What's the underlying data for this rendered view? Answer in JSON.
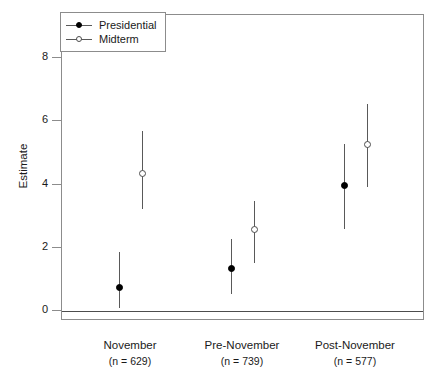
{
  "chart_data": {
    "type": "scatter",
    "title": "",
    "xlabel": "",
    "ylabel": "Estimate",
    "ylim": [
      -0.55,
      9.2
    ],
    "yticks": [
      0,
      2,
      4,
      6,
      8
    ],
    "ytick_labels": [
      "0",
      "2",
      "4",
      "6",
      "8"
    ],
    "grid": false,
    "zero_line": 0,
    "legend_position": "top-left",
    "categories": [
      "November",
      "Pre-November",
      "Post-November"
    ],
    "category_n": [
      "(n = 629)",
      "(n = 739)",
      "(n = 577)"
    ],
    "series": [
      {
        "name": "Presidential",
        "marker": "filled-circle",
        "color": "#000000",
        "values": [
          0.73,
          1.36,
          3.96
        ],
        "ci_low": [
          0.09,
          0.55,
          2.6
        ],
        "ci_high": [
          1.86,
          2.28,
          5.29
        ]
      },
      {
        "name": "Midterm",
        "marker": "open-circle",
        "color": "#4d4d4d",
        "values": [
          4.34,
          2.59,
          5.28
        ],
        "ci_low": [
          3.23,
          1.52,
          3.92
        ],
        "ci_high": [
          5.7,
          3.49,
          6.55
        ]
      }
    ]
  },
  "legend": {
    "items": [
      {
        "label": "Presidential",
        "marker": "filled-circle"
      },
      {
        "label": "Midterm",
        "marker": "open-circle"
      }
    ]
  },
  "axes": {
    "y_title": "Estimate",
    "y_tick_labels": [
      "0",
      "2",
      "4",
      "6",
      "8"
    ]
  },
  "x_groups": [
    {
      "label": "November",
      "n": "(n = 629)"
    },
    {
      "label": "Pre-November",
      "n": "(n = 739)"
    },
    {
      "label": "Post-November",
      "n": "(n = 577)"
    }
  ]
}
